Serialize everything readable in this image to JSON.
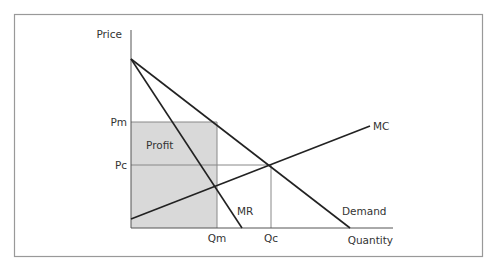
{
  "diagram": {
    "type": "monopoly-vs-competition",
    "colors": {
      "line": "#222222",
      "frame": "#999999",
      "profit_fill": "#d9d9d9",
      "text": "#333333",
      "guide": "#888888"
    },
    "axes": {
      "y_label": "Price",
      "x_label": "Quantity"
    },
    "price_ticks": [
      {
        "label": "Pm"
      },
      {
        "label": "Pc"
      }
    ],
    "quantity_ticks": [
      {
        "label": "Qm"
      },
      {
        "label": "Qc"
      }
    ],
    "curves": [
      {
        "label": "MC"
      },
      {
        "label": "MR"
      },
      {
        "label": "Demand"
      }
    ],
    "regions": [
      {
        "label": "Profit"
      }
    ]
  }
}
